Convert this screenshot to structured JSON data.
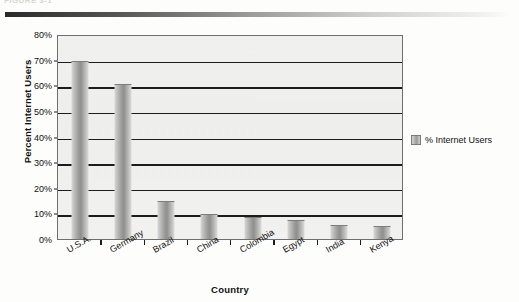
{
  "figure": {
    "caption_fragment": "FIGURE 3-1"
  },
  "chart_data": {
    "type": "bar",
    "title": "",
    "categories": [
      "U.S.A.",
      "Germany",
      "Brazil",
      "China",
      "Colombia",
      "Egypt",
      "India",
      "Kenya"
    ],
    "values": [
      69,
      60,
      14.5,
      9.3,
      8.3,
      7,
      5,
      4.5
    ],
    "series": [
      {
        "name": "% Internet Users",
        "values": [
          69,
          60,
          14.5,
          9.3,
          8.3,
          7,
          5,
          4.5
        ]
      }
    ],
    "xlabel": "Country",
    "ylabel": "Percent Internet Users",
    "ylim": [
      0,
      80
    ],
    "ytick_labels": [
      "80%",
      "70%",
      "60%",
      "50%",
      "40%",
      "30%",
      "20%",
      "10%",
      "0%"
    ],
    "ytick_values": [
      80,
      70,
      60,
      50,
      40,
      30,
      20,
      10,
      0
    ],
    "grid": true,
    "legend_position": "right",
    "legend_entries": [
      "% Internet Users"
    ],
    "bar_color": "#9d9d9b",
    "plot_background": "#efefed",
    "gridline_color": "#1c1c1c"
  }
}
